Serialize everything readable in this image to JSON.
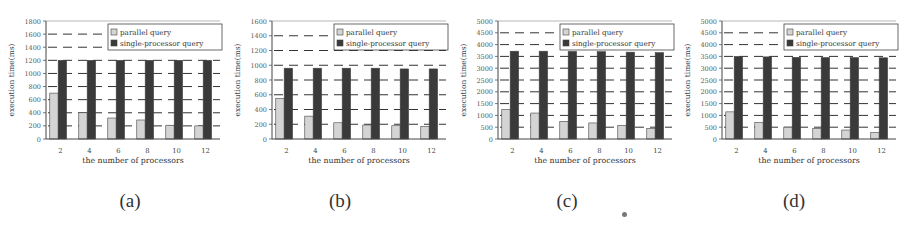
{
  "chart_data": [
    {
      "type": "bar",
      "panel_label": "(a)",
      "title": "",
      "xlabel": "the number of processors",
      "ylabel": "execution time(ms)",
      "categories": [
        "2",
        "4",
        "6",
        "8",
        "10",
        "12"
      ],
      "ylim": [
        0,
        1800
      ],
      "yticks": [
        0,
        200,
        400,
        600,
        800,
        1000,
        1200,
        1400,
        1600,
        1800
      ],
      "grid": "dashed horizontal",
      "legend_position": "upper right",
      "series": [
        {
          "name": "parallel query",
          "color": "#d4d4d4",
          "values": [
            700,
            400,
            320,
            290,
            210,
            200
          ]
        },
        {
          "name": "single-processor query",
          "color": "#3a3a3a",
          "values": [
            1200,
            1200,
            1200,
            1200,
            1200,
            1200
          ]
        }
      ]
    },
    {
      "type": "bar",
      "panel_label": "(b)",
      "title": "",
      "xlabel": "the number of processors",
      "ylabel": "execution time(ms)",
      "categories": [
        "2",
        "4",
        "6",
        "8",
        "10",
        "12"
      ],
      "ylim": [
        0,
        1600
      ],
      "yticks": [
        0,
        200,
        400,
        600,
        800,
        1000,
        1200,
        1400,
        1600
      ],
      "grid": "dashed horizontal",
      "legend_position": "upper right",
      "series": [
        {
          "name": "parallel query",
          "color": "#d4d4d4",
          "values": [
            550,
            310,
            220,
            190,
            180,
            170
          ]
        },
        {
          "name": "single-processor query",
          "color": "#3a3a3a",
          "values": [
            960,
            960,
            960,
            960,
            950,
            950
          ]
        }
      ]
    },
    {
      "type": "bar",
      "panel_label": "(c)",
      "title": "",
      "xlabel": "the number of processors",
      "ylabel": "execution time(ms)",
      "categories": [
        "2",
        "4",
        "6",
        "8",
        "10",
        "12"
      ],
      "ylim": [
        0,
        5000
      ],
      "yticks": [
        0,
        500,
        1000,
        1500,
        2000,
        2500,
        3000,
        3500,
        4000,
        4500,
        5000
      ],
      "grid": "dashed horizontal",
      "legend_position": "upper right",
      "series": [
        {
          "name": "parallel query",
          "color": "#d4d4d4",
          "values": [
            1250,
            1100,
            750,
            680,
            580,
            450
          ]
        },
        {
          "name": "single-processor query",
          "color": "#3a3a3a",
          "values": [
            3720,
            3720,
            3710,
            3700,
            3680,
            3660
          ]
        }
      ]
    },
    {
      "type": "bar",
      "panel_label": "(d)",
      "title": "",
      "xlabel": "the number of processors",
      "ylabel": "execution time(ms)",
      "categories": [
        "2",
        "4",
        "6",
        "8",
        "10",
        "12"
      ],
      "ylim": [
        0,
        5000
      ],
      "yticks": [
        0,
        500,
        1000,
        1500,
        2000,
        2500,
        3000,
        3500,
        4000,
        4500,
        5000
      ],
      "grid": "dashed horizontal",
      "legend_position": "upper right",
      "series": [
        {
          "name": "parallel query",
          "color": "#d4d4d4",
          "values": [
            1150,
            700,
            500,
            450,
            380,
            270
          ]
        },
        {
          "name": "single-processor query",
          "color": "#3a3a3a",
          "values": [
            3500,
            3480,
            3460,
            3450,
            3450,
            3440
          ]
        }
      ]
    }
  ],
  "captions": [
    "(a)",
    "(b)",
    "(c)",
    "(d)"
  ]
}
